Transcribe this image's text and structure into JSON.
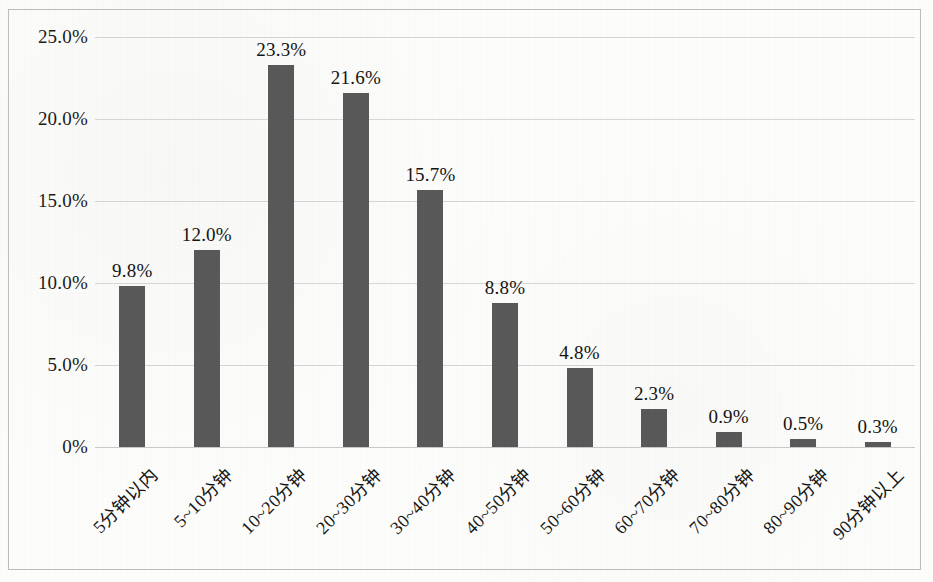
{
  "chart_data": {
    "type": "bar",
    "title": "",
    "subtitle": "",
    "xlabel": "",
    "ylabel": "",
    "categories": [
      "5分钟以内",
      "5~10分钟",
      "10~20分钟",
      "20~30分钟",
      "30~40分钟",
      "40~50分钟",
      "50~60分钟",
      "60~70分钟",
      "70~80分钟",
      "80~90分钟",
      "90分钟以上"
    ],
    "values": [
      9.8,
      12.0,
      23.3,
      21.6,
      15.7,
      8.8,
      4.8,
      2.3,
      0.9,
      0.5,
      0.3
    ],
    "value_labels": [
      "9.8%",
      "12.0%",
      "23.3%",
      "21.6%",
      "15.7%",
      "8.8%",
      "4.8%",
      "2.3%",
      "0.9%",
      "0.5%",
      "0.3%"
    ],
    "ylim": [
      0,
      25
    ],
    "ytick_values": [
      0,
      5,
      10,
      15,
      20,
      25
    ],
    "ytick_labels": [
      "0%",
      "5.0%",
      "10.0%",
      "15.0%",
      "20.0%",
      "25.0%"
    ],
    "grid": true,
    "legend": false,
    "legend_position": "none",
    "bar_color": "#595959",
    "gridline_color": "#d6d6d6",
    "frame_color": "#bdbdbd",
    "background_color": "#fdfdfb",
    "label_rotation_degrees": -45
  }
}
